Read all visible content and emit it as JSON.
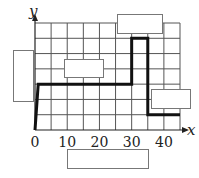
{
  "chart_data": {
    "type": "line",
    "title": "",
    "xlabel": "x",
    "ylabel": "y",
    "xlim": [
      0,
      45
    ],
    "ylim": [
      0,
      7
    ],
    "x_grid_step": 5,
    "y_grid_step": 1,
    "grid": true,
    "x_tick_labels": [
      {
        "value": 0,
        "label": "0"
      },
      {
        "value": 10,
        "label": "10"
      },
      {
        "value": 20,
        "label": "20"
      },
      {
        "value": 30,
        "label": "30"
      },
      {
        "value": 40,
        "label": "40"
      }
    ],
    "series": [
      {
        "name": "path",
        "points": [
          [
            0,
            0
          ],
          [
            1,
            3
          ],
          [
            30,
            3
          ],
          [
            30,
            6
          ],
          [
            35,
            6
          ],
          [
            35,
            1
          ],
          [
            45,
            1
          ]
        ]
      }
    ],
    "label_boxes": [
      {
        "name": "y-axis-label-box",
        "text": ""
      },
      {
        "name": "middle-label-box",
        "text": ""
      },
      {
        "name": "top-label-box",
        "text": ""
      },
      {
        "name": "right-label-box",
        "text": ""
      },
      {
        "name": "x-axis-label-box",
        "text": ""
      }
    ]
  }
}
